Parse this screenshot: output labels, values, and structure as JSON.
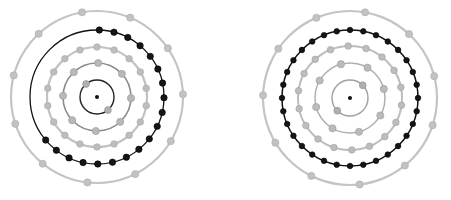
{
  "diagram": {
    "background": "#ffffff",
    "atoms": [
      {
        "id": "left-atom",
        "center": [
          97,
          97
        ],
        "nucleus": {
          "radius": 2,
          "color": "#111111"
        },
        "shells": [
          {
            "radius": 17,
            "stroke": "#222222",
            "width": 1.4,
            "electrons": 2,
            "start_angle": -130,
            "span": 360,
            "electron_color": "#b0b0b0",
            "electron_edge": "#8a8a8a",
            "electron_radius": 3.4
          },
          {
            "radius": 34,
            "stroke": "#8a8a8a",
            "width": 1.6,
            "electrons": 8,
            "start_angle": -88,
            "span": 360,
            "electron_color": "#b8b8b8",
            "electron_edge": "#9a9a9a",
            "electron_radius": 3.6
          },
          {
            "radius": 50,
            "stroke": "#c2c2c2",
            "width": 2.2,
            "electrons": 18,
            "start_angle": -90,
            "span": 360,
            "electron_color": "#bdbdbd",
            "electron_edge": "#a8a8a8",
            "electron_radius": 3.3
          },
          {
            "radius": 67,
            "stroke": "#111111",
            "width": 1.3,
            "electrons": 19,
            "start_angle": -88,
            "span": 228,
            "electron_color": "#151515",
            "electron_edge": "#000000",
            "electron_radius": 3.2
          },
          {
            "radius": 86,
            "stroke": "#c4c4c4",
            "width": 2.2,
            "electrons": 11,
            "start_angle": -100,
            "span": 360,
            "electron_color": "#c2c2c2",
            "electron_edge": "#acacac",
            "electron_radius": 3.6
          }
        ]
      },
      {
        "id": "right-atom",
        "center": [
          350,
          98
        ],
        "nucleus": {
          "radius": 2,
          "color": "#111111"
        },
        "shells": [
          {
            "radius": 18,
            "stroke": "#a0a0a0",
            "width": 1.4,
            "electrons": 2,
            "start_angle": -45,
            "span": 360,
            "electron_color": "#b0b0b0",
            "electron_edge": "#8a8a8a",
            "electron_radius": 3.4
          },
          {
            "radius": 35,
            "stroke": "#b0b0b0",
            "width": 1.5,
            "electrons": 8,
            "start_angle": -60,
            "span": 360,
            "electron_color": "#bbbbbb",
            "electron_edge": "#9a9a9a",
            "electron_radius": 3.6
          },
          {
            "radius": 52,
            "stroke": "#bdbdbd",
            "width": 2.0,
            "electrons": 18,
            "start_angle": -92,
            "span": 360,
            "electron_color": "#bdbdbd",
            "electron_edge": "#a0a0a0",
            "electron_radius": 3.3
          },
          {
            "radius": 68,
            "stroke": "#111111",
            "width": 1.5,
            "electrons": 32,
            "start_angle": -90,
            "span": 360,
            "electron_color": "#151515",
            "electron_edge": "#000000",
            "electron_radius": 2.8
          },
          {
            "radius": 87,
            "stroke": "#c4c4c4",
            "width": 2.2,
            "electrons": 11,
            "start_angle": -80,
            "span": 360,
            "electron_color": "#c2c2c2",
            "electron_edge": "#acacac",
            "electron_radius": 3.6
          }
        ]
      }
    ]
  }
}
